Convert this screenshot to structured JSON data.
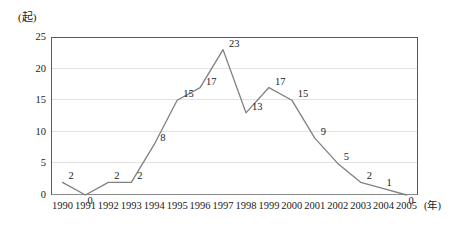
{
  "chart_data": {
    "type": "line",
    "title": "",
    "subtitle": "",
    "xlabel": "(年)",
    "ylabel": "(起)",
    "categories": [
      "1990",
      "1991",
      "1992",
      "1993",
      "1994",
      "1995",
      "1996",
      "1997",
      "1998",
      "1999",
      "2000",
      "2001",
      "2002",
      "2003",
      "2004",
      "2005"
    ],
    "values": [
      2,
      0,
      2,
      2,
      8,
      15,
      17,
      23,
      13,
      17,
      15,
      9,
      5,
      2,
      1,
      0
    ],
    "point_labels": [
      "2",
      "0",
      "2",
      "2",
      "8",
      "15",
      "17",
      "23",
      "13",
      "17",
      "15",
      "9",
      "5",
      "2",
      "1",
      "0"
    ],
    "ylim": [
      0,
      25
    ],
    "yticks": [
      "0",
      "5",
      "10",
      "15",
      "20",
      "25"
    ],
    "ytick_values": [
      0,
      5,
      10,
      15,
      20,
      25
    ],
    "grid": true,
    "grid_axis": "y",
    "legend": "none",
    "series": [
      {
        "name": "",
        "values": [
          2,
          0,
          2,
          2,
          8,
          15,
          17,
          23,
          13,
          17,
          15,
          9,
          5,
          2,
          1,
          0
        ],
        "color": "#808080"
      }
    ],
    "colors": {
      "line": "#808080",
      "grid": "#e2e2e2",
      "frame": "#595959",
      "text": "#1a1a1a",
      "background": "#ffffff"
    }
  }
}
